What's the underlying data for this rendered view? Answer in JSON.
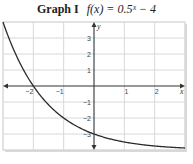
{
  "header": {
    "label": "Graph I",
    "formula": "f(x) = 0.5ˣ − 4"
  },
  "chart_data": {
    "type": "line",
    "xlabel": "x",
    "ylabel": "y",
    "xlim": [
      -3,
      3
    ],
    "ylim": [
      -4,
      4
    ],
    "grid": true,
    "x_ticks": [
      -2,
      -1,
      1,
      2
    ],
    "y_ticks": [
      3,
      2,
      1,
      -1,
      -2,
      -3
    ],
    "x_tick_labels": [
      "−2",
      "−1",
      "1",
      "2"
    ],
    "y_tick_labels": [
      "3",
      "2",
      "1",
      "−1",
      "−2",
      "−3"
    ],
    "series": [
      {
        "name": "f(x) = 0.5^x − 4",
        "function": "0.5^x - 4",
        "x": [
          -3,
          -2.5,
          -2,
          -1.5,
          -1,
          -0.5,
          0,
          0.5,
          1,
          1.5,
          2,
          2.5,
          3
        ],
        "y": [
          4,
          1.66,
          0,
          -1.17,
          -2,
          -2.59,
          -3,
          -3.29,
          -3.5,
          -3.65,
          -3.75,
          -3.82,
          -3.875
        ]
      }
    ],
    "annotations": {
      "x_intercept": -2,
      "y_intercept": -3,
      "asymptote": -4
    }
  }
}
